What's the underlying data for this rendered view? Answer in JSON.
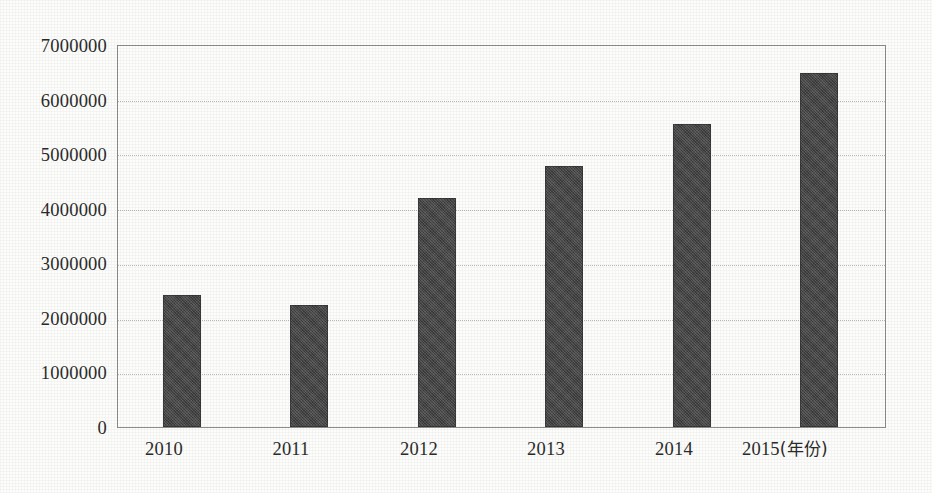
{
  "chart_data": {
    "type": "bar",
    "title": "",
    "subtitle": "",
    "xlabel": "年份",
    "ylabel": "",
    "categories": [
      "2010",
      "2011",
      "2012",
      "2013",
      "2014",
      "2015"
    ],
    "values": [
      2430000,
      2250000,
      4200000,
      4800000,
      5560000,
      6500000
    ],
    "series": [
      {
        "name": "",
        "values": [
          2430000,
          2250000,
          4200000,
          4800000,
          5560000,
          6500000
        ]
      }
    ],
    "ylim": [
      0,
      7000000
    ],
    "ytick_values": [
      0,
      1000000,
      2000000,
      3000000,
      4000000,
      5000000,
      6000000,
      7000000
    ],
    "ytick_labels": [
      "0",
      "1000000",
      "2000000",
      "3000000",
      "4000000",
      "5000000",
      "6000000",
      "7000000"
    ],
    "xtick_labels": [
      "2010",
      "2011",
      "2012",
      "2013",
      "2014",
      "2015"
    ],
    "x_axis_unit_suffix": "(年份)",
    "grid": "horizontal-dotted",
    "legend": "none",
    "legend_position": "none",
    "bar_color": "#474747",
    "plot_border_color": "#8d8d8d",
    "gridline_color": "#b9b9b9",
    "background_color": "#fdfdfb",
    "annotations": []
  },
  "axis": {
    "x_last_label_full": "2015(年份)"
  }
}
